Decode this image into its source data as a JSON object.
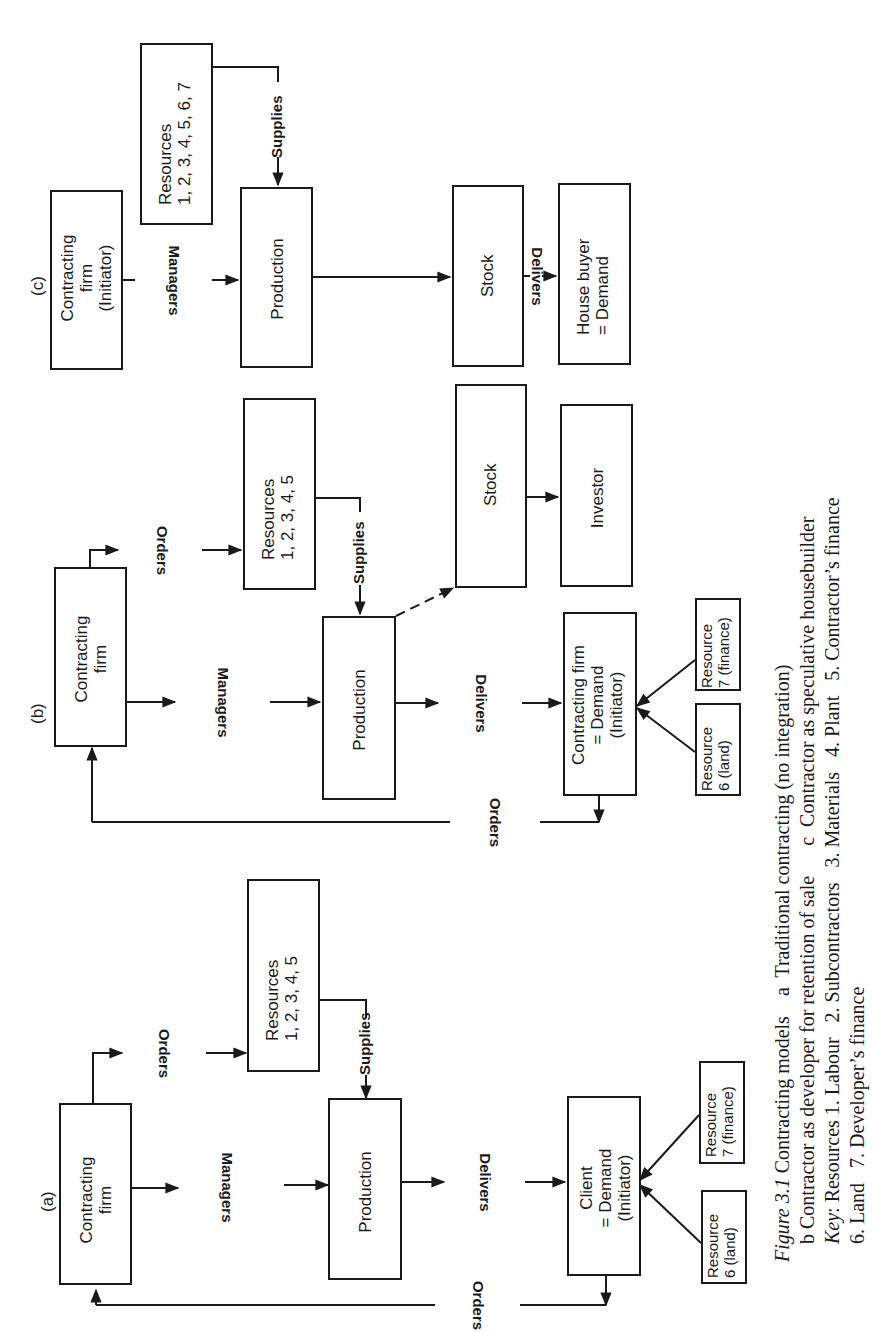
{
  "figure": {
    "label": "Figure 3.1",
    "caption_lines": [
      "Figure 3.1  Contracting models   a  Traditional contracting (no integration)",
      "b Contractor as developer for retention of sale     c  Contractor as speculative housebuilder",
      "Key: Resources 1. Labour   2. Subcontractors   3. Materials   4. Plant   5. Contractor's finance",
      "6. Land   7. Developer's finance"
    ],
    "caption": {
      "title_italic": "Figure 3.1",
      "line1_rest": " Contracting models    a  Traditional contracting (no integration)",
      "line2": "b Contractor as developer for retention of sale      c  Contractor as speculative housebuilder",
      "line3_key": "Key",
      "line3_rest": ": Resources 1. Labour   2. Subcontractors   3. Materials   4. Plant   5. Contractor’s finance",
      "line4": "6. Land   7. Developer’s finance"
    }
  },
  "diagrams": {
    "a": {
      "label": "(a)",
      "boxes": {
        "contracting_firm": "Contracting\nfirm",
        "resources": "Resources\n1, 2, 3, 4, 5",
        "production": "Production",
        "client": "Client\n= Demand\n(Initiator)",
        "resource6": "Resource\n6 (land)",
        "resource7": "Resource\n7 (finance)"
      },
      "flows": {
        "orders_top": "Orders",
        "managers": "Managers",
        "supplies": "Supplies",
        "delivers": "Delivers",
        "orders_bottom": "Orders"
      }
    },
    "b": {
      "label": "(b)",
      "boxes": {
        "contracting_firm": "Contracting\nfirm",
        "resources": "Resources\n1, 2, 3, 4, 5",
        "production": "Production",
        "stock": "Stock",
        "investor": "Investor",
        "demand": "Contracting firm\n= Demand\n(Initiator)",
        "resource6": "Resource\n6 (land)",
        "resource7": "Resource\n7 (finance)"
      },
      "flows": {
        "orders_top": "Orders",
        "managers": "Managers",
        "supplies": "Supplies",
        "delivers": "Delivers",
        "orders_bottom": "Orders"
      }
    },
    "c": {
      "label": "(c)",
      "boxes": {
        "contracting_firm": "Contracting\nfirm\n(Initiator)",
        "resources": "Resources\n1, 2, 3, 4, 5, 6, 7",
        "production": "Production",
        "stock": "Stock",
        "house_buyer": "House buyer\n= Demand"
      },
      "flows": {
        "managers": "Managers",
        "supplies": "Supplies",
        "delivers": "Delivers"
      }
    }
  },
  "colors": {
    "ink": "#1a1a1a",
    "paper": "#ffffff"
  }
}
